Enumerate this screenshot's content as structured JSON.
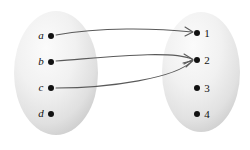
{
  "diagram": {
    "background_color": "#ffffff",
    "stroke_color": "#5a5a5a",
    "dot_color": "#111111",
    "ellipse_fill_light": "#f6f6f6",
    "ellipse_fill_dark": "#cfcfcf",
    "domain_set": {
      "name": "domain-ellipse",
      "center_x": 56,
      "center_y": 73,
      "rx": 42,
      "ry": 62,
      "elements": [
        {
          "label": "a",
          "style": "italic",
          "x": 51,
          "y": 36,
          "label_x": 41,
          "label_y": 39
        },
        {
          "label": "b",
          "style": "italic",
          "x": 51,
          "y": 62,
          "label_x": 41,
          "label_y": 65
        },
        {
          "label": "c",
          "style": "italic",
          "x": 51,
          "y": 88,
          "label_x": 41,
          "label_y": 91
        },
        {
          "label": "d",
          "style": "italic",
          "x": 51,
          "y": 114,
          "label_x": 41,
          "label_y": 117
        }
      ]
    },
    "codomain_set": {
      "name": "codomain-ellipse",
      "center_x": 201,
      "center_y": 72,
      "rx": 39,
      "ry": 60,
      "elements": [
        {
          "label": "1",
          "style": "upright",
          "x": 197,
          "y": 33,
          "label_x": 207,
          "label_y": 37
        },
        {
          "label": "2",
          "style": "upright",
          "x": 197,
          "y": 60,
          "label_x": 207,
          "label_y": 64
        },
        {
          "label": "3",
          "style": "upright",
          "x": 197,
          "y": 88,
          "label_x": 207,
          "label_y": 92
        },
        {
          "label": "4",
          "style": "upright",
          "x": 197,
          "y": 114,
          "label_x": 207,
          "label_y": 118
        }
      ]
    },
    "mappings": [
      {
        "from": "a",
        "to": "1",
        "path": "M 56 35 C 100 27, 155 28, 192 32",
        "head": "M 185 27 L 193 32 L 185 36"
      },
      {
        "from": "b",
        "to": "2",
        "path": "M 56 61 C 110 57, 170 50, 192 59",
        "head": "M 184 54 L 193 59.5 L 184 64"
      },
      {
        "from": "c",
        "to": "2",
        "path": "M 56 88 C 110 88, 176 78, 192 61",
        "head": "M 183 63 L 193 60.5 L 186 67"
      }
    ],
    "unmapped_domain_elements": [
      "d"
    ],
    "unmapped_codomain_elements": [
      "3",
      "4"
    ]
  }
}
